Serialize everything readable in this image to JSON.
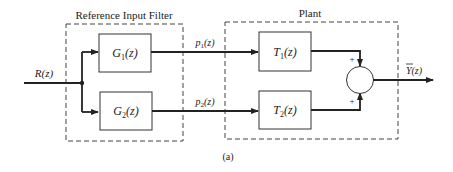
{
  "diagram": {
    "caption": "(a)",
    "groups": [
      {
        "id": "filter",
        "label": "Reference Input Filter"
      },
      {
        "id": "plant",
        "label": "Plant"
      }
    ],
    "blocks": [
      {
        "id": "g1",
        "label_main": "G",
        "label_sub": "1",
        "label_arg": "(z)"
      },
      {
        "id": "g2",
        "label_main": "G",
        "label_sub": "2",
        "label_arg": "(z)"
      },
      {
        "id": "t1",
        "label_main": "T",
        "label_sub": "1",
        "label_arg": "(z)"
      },
      {
        "id": "t2",
        "label_main": "T",
        "label_sub": "2",
        "label_arg": "(z)"
      }
    ],
    "signals": {
      "input": "R(z)",
      "p1_main": "p",
      "p1_sub": "1",
      "p1_arg": "(z)",
      "p2_main": "p",
      "p2_sub": "2",
      "p2_arg": "(z)",
      "output": "Y(z)"
    },
    "summing_junction": {
      "sign_top": "+",
      "sign_bottom": "+"
    }
  }
}
